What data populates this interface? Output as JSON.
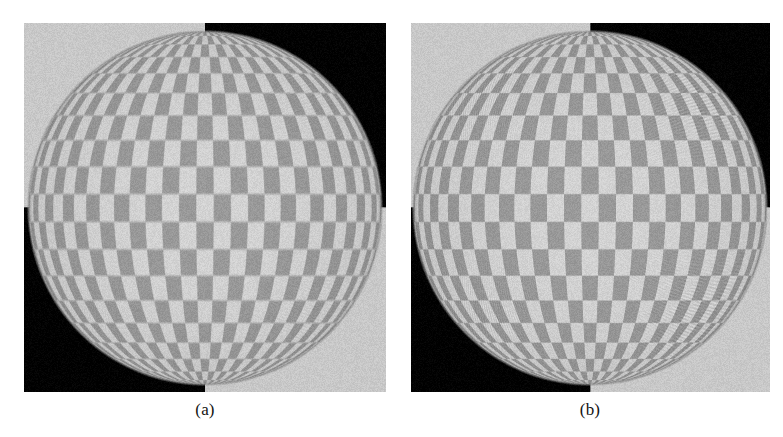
{
  "figure": {
    "width": 783,
    "height": 437,
    "background": "#ffffff",
    "kind": "two-panel-image-comparison"
  },
  "panels": [
    {
      "id": "panel-a",
      "caption": "(a)",
      "x": 24,
      "y": 23,
      "w": 362,
      "h": 369,
      "caption_x": 145,
      "caption_y": 400,
      "caption_w": 120,
      "background_quadrants": {
        "top_left": "#c8c8c8",
        "top_right": "#000000",
        "bottom_left": "#000000",
        "bottom_right": "#c8c8c8"
      },
      "sphere": {
        "center_x": 181,
        "center_y": 185,
        "radius": 177,
        "checker_light": "#cdcdcd",
        "checker_dark": "#959595",
        "rim_color": "#6e6e6e",
        "checker_u_divisions": 16,
        "checker_v_divisions": 10,
        "texture_sharpness": "smooth-filtered",
        "aliasing_strength": 0.35,
        "noise_amount": 9
      }
    },
    {
      "id": "panel-b",
      "caption": "(b)",
      "x": 411,
      "y": 23,
      "w": 359,
      "h": 369,
      "caption_x": 530,
      "caption_y": 400,
      "caption_w": 120,
      "background_quadrants": {
        "top_left": "#c8c8c8",
        "top_right": "#000000",
        "bottom_left": "#000000",
        "bottom_right": "#c8c8c8"
      },
      "sphere": {
        "center_x": 179,
        "center_y": 185,
        "radius": 177,
        "checker_light": "#cdcdcd",
        "checker_dark": "#959595",
        "rim_color": "#6e6e6e",
        "checker_u_divisions": 16,
        "checker_v_divisions": 10,
        "texture_sharpness": "aliased-sharp",
        "aliasing_strength": 1.0,
        "noise_amount": 9
      }
    }
  ]
}
